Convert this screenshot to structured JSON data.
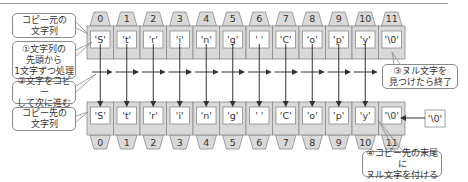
{
  "colors": {
    "cell_fill": "#d9d9d9",
    "cell_stroke": "#8a8a8a",
    "inner_fill": "#ffffff",
    "arrow": "#333333",
    "callout_border": "#8a8a8a"
  },
  "source_row": {
    "label": "コピー元の\n文字列",
    "indices": [
      "0",
      "1",
      "2",
      "3",
      "4",
      "5",
      "6",
      "7",
      "8",
      "9",
      "10",
      "11"
    ],
    "chars": [
      "'S'",
      "'t'",
      "'r'",
      "'i'",
      "'n'",
      "'g'",
      "' '",
      "'C'",
      "'o'",
      "'p'",
      "'y'",
      "'\\0'"
    ]
  },
  "dest_row": {
    "label": "コピー先の\n文字列",
    "indices": [
      "0",
      "1",
      "2",
      "3",
      "4",
      "5",
      "6",
      "7",
      "8",
      "9",
      "10",
      "11"
    ],
    "chars": [
      "'S'",
      "'t'",
      "'r'",
      "'i'",
      "'n'",
      "'g'",
      "' '",
      "'C'",
      "'o'",
      "'p'",
      "'y'",
      "'\\0'"
    ]
  },
  "null_char_source": "'\\0'",
  "callouts": {
    "step1": "①文字列の\n先頭から\n1文字ずつ処理",
    "step2": "②文字をコピー\nして次に進む",
    "step3": "③ヌル文字を\n見つけたら終了",
    "step4": "④コピー先の末尾に\nヌル文字を付ける"
  }
}
